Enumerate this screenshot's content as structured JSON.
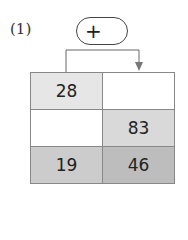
{
  "problem_label": "(1)",
  "operator": "+",
  "grid": {
    "rows": [
      [
        "28",
        ""
      ],
      [
        "",
        "83"
      ],
      [
        "19",
        "46"
      ]
    ]
  },
  "colors": {
    "cell_light": "#e6e6e6",
    "cell_mid": "#d9d9d9",
    "cell_dark": "#cccccc",
    "cell_darkest": "#bdbdbd",
    "border": "#888888"
  }
}
